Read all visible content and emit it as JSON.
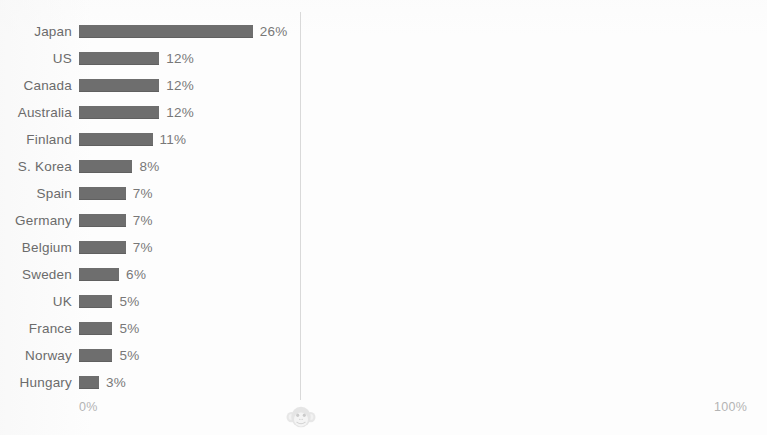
{
  "chart_data": {
    "type": "bar",
    "orientation": "horizontal",
    "title": "",
    "xlabel": "",
    "ylabel": "",
    "xlim": [
      0,
      100
    ],
    "grid": false,
    "legend": null,
    "axis_ticks": [
      "0%",
      "100%"
    ],
    "bar_color": "#6e6e6e",
    "label_color": "#6b6b6b",
    "value_label_color": "#787878",
    "tick_color": "#b4b4b4",
    "axis_line_color": "#d9d9d9",
    "categories": [
      "Japan",
      "US",
      "Canada",
      "Australia",
      "Finland",
      "S. Korea",
      "Spain",
      "Germany",
      "Belgium",
      "Sweden",
      "UK",
      "France",
      "Norway",
      "Hungary"
    ],
    "values": [
      26,
      12,
      12,
      12,
      11,
      8,
      7,
      7,
      7,
      6,
      5,
      5,
      5,
      3
    ],
    "value_labels": [
      "26%",
      "12%",
      "12%",
      "12%",
      "11%",
      "8%",
      "7%",
      "7%",
      "7%",
      "6%",
      "5%",
      "5%",
      "5%",
      "3%"
    ]
  },
  "axis": {
    "min_label": "0%",
    "max_label": "100%"
  },
  "watermark": {
    "icon": "monkey-face-icon"
  }
}
